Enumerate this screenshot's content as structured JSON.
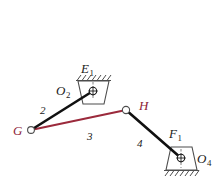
{
  "figure": {
    "type": "kinematic-linkage-diagram",
    "width": 223,
    "height": 188,
    "background": "#ffffff"
  },
  "colors": {
    "link_black": "#111111",
    "link_red": "#9b2a3c",
    "joint_label_red": "#8e2438",
    "text_black": "#1a1a1a",
    "ground_outline": "#4d4d4d",
    "joint_fill": "#ffffff"
  },
  "labels": {
    "ground_upper": {
      "base": "E",
      "sub": "1"
    },
    "pivot_upper": {
      "base": "O",
      "sub": "2"
    },
    "ground_lower": {
      "base": "F",
      "sub": "1"
    },
    "pivot_lower": {
      "base": "O",
      "sub": "4"
    },
    "joint_left": "G",
    "joint_mid": "H",
    "link2_number": "2",
    "link3_number": "3",
    "link4_number": "4"
  },
  "geometry": {
    "joints": [
      {
        "name": "G",
        "x": 31,
        "y": 130,
        "kind": "pin-open"
      },
      {
        "name": "O2",
        "x": 93,
        "y": 91,
        "kind": "ground-pivot"
      },
      {
        "name": "H",
        "x": 126,
        "y": 110,
        "kind": "pin-open"
      },
      {
        "name": "O4",
        "x": 181,
        "y": 158,
        "kind": "ground-pivot"
      }
    ],
    "links": [
      {
        "number": "2",
        "from": "G",
        "to": "O2",
        "color": "black"
      },
      {
        "number": "3",
        "from": "G",
        "to": "H",
        "color": "red"
      },
      {
        "number": "4",
        "from": "H",
        "to": "O4",
        "color": "black"
      }
    ],
    "grounds": [
      {
        "name": "E1",
        "pivot": "O2",
        "hatch_side": "top"
      },
      {
        "name": "F1",
        "pivot": "O4",
        "hatch_side": "bottom"
      }
    ]
  }
}
